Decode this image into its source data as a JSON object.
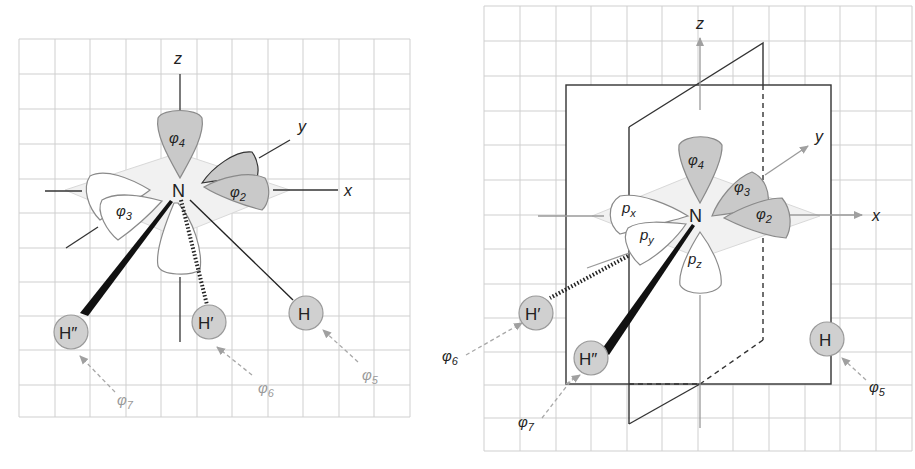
{
  "figure": {
    "left_panel": {
      "axes": {
        "z": "z",
        "y": "y",
        "x": "x"
      },
      "center_atom": "N",
      "orbitals": [
        {
          "id": "phi4",
          "symbol": "φ",
          "sub": "4",
          "shade": "dark"
        },
        {
          "id": "phi2",
          "symbol": "φ",
          "sub": "2",
          "shade": "dark"
        },
        {
          "id": "phi3",
          "symbol": "φ",
          "sub": "3",
          "shade": "light"
        }
      ],
      "hydrogens": [
        {
          "id": "H",
          "label": "H",
          "bond": "plain",
          "arrow_label_symbol": "φ",
          "arrow_label_sub": "5"
        },
        {
          "id": "H1",
          "label": "H′",
          "bond": "hashed",
          "arrow_label_symbol": "φ",
          "arrow_label_sub": "6"
        },
        {
          "id": "H2",
          "label": "H″",
          "bond": "wedge",
          "arrow_label_symbol": "φ",
          "arrow_label_sub": "7"
        }
      ]
    },
    "right_panel": {
      "axes": {
        "z": "z",
        "y": "y",
        "x": "x"
      },
      "center_atom": "N",
      "orbitals": [
        {
          "id": "phi4",
          "symbol": "φ",
          "sub": "4",
          "shade": "dark"
        },
        {
          "id": "phi3",
          "symbol": "φ",
          "sub": "3",
          "shade": "dark"
        },
        {
          "id": "phi2",
          "symbol": "φ",
          "sub": "2",
          "shade": "dark"
        },
        {
          "id": "px",
          "symbol": "p",
          "sub": "x",
          "shade": "light"
        },
        {
          "id": "py",
          "symbol": "p",
          "sub": "y",
          "shade": "light"
        },
        {
          "id": "pz",
          "symbol": "p",
          "sub": "z",
          "shade": "light"
        }
      ],
      "hydrogens": [
        {
          "id": "H",
          "label": "H",
          "arrow_label_symbol": "φ",
          "arrow_label_sub": "5"
        },
        {
          "id": "H1",
          "label": "H′",
          "arrow_label_symbol": "φ",
          "arrow_label_sub": "6"
        },
        {
          "id": "H2",
          "label": "H″",
          "arrow_label_symbol": "φ",
          "arrow_label_sub": "7"
        }
      ]
    }
  }
}
